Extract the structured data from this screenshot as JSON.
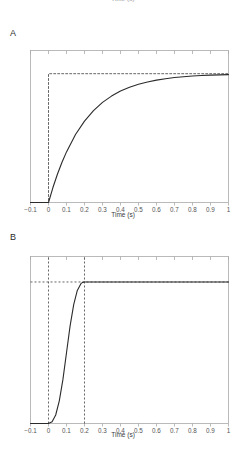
{
  "figure": {
    "clipped_top_caption": "Time (s)",
    "background_color": "#ffffff",
    "line_color": "#2b2b2b",
    "dashed_color": "#555555",
    "axis_color": "#aaaaaa",
    "tick_label_color": "#555555"
  },
  "panels": [
    {
      "letter": "A",
      "xlabel": "Time (s)",
      "tick_labels": [
        "−0.1",
        "0",
        "0.1",
        "0.2",
        "0.3",
        "0.4",
        "0.5",
        "0.6",
        "0.7",
        "0.8",
        "0.9",
        "1"
      ]
    },
    {
      "letter": "B",
      "xlabel": "Time (s)",
      "tick_labels": [
        "−0.1",
        "0",
        "0.1",
        "0.2",
        "0.3",
        "0.4",
        "0.5",
        "0.6",
        "0.7",
        "0.8",
        "0.9",
        "1"
      ]
    }
  ],
  "chart_data": [
    {
      "type": "line",
      "panel": "A",
      "title": "",
      "xlabel": "Time (s)",
      "ylabel": "",
      "xlim": [
        -0.1,
        1.0
      ],
      "ylim": [
        0.0,
        1.18
      ],
      "xticks": [
        -0.1,
        0,
        0.1,
        0.2,
        0.3,
        0.4,
        0.5,
        0.6,
        0.7,
        0.8,
        0.9,
        1.0
      ],
      "xtick_labels": [
        "−0.1",
        "0",
        "0.1",
        "0.2",
        "0.3",
        "0.4",
        "0.5",
        "0.6",
        "0.7",
        "0.8",
        "0.9",
        "1"
      ],
      "yticks": [],
      "grid": false,
      "legend": false,
      "series": [
        {
          "name": "step input",
          "style": "dashed",
          "color": "#555555",
          "x": [
            -0.1,
            0.0,
            0.0,
            1.0
          ],
          "y": [
            0.0,
            0.0,
            1.0,
            1.0
          ]
        },
        {
          "name": "first-order response",
          "style": "solid",
          "color": "#2b2b2b",
          "description": "y = 0 for t<0; y = 1 - exp(-t/0.2) for t>=0",
          "x": [
            -0.1,
            -0.05,
            0.0,
            0.025,
            0.05,
            0.075,
            0.1,
            0.15,
            0.2,
            0.25,
            0.3,
            0.35,
            0.4,
            0.45,
            0.5,
            0.55,
            0.6,
            0.65,
            0.7,
            0.75,
            0.8,
            0.85,
            0.9,
            0.95,
            1.0
          ],
          "y": [
            0.0,
            0.0,
            0.0,
            0.118,
            0.221,
            0.313,
            0.393,
            0.528,
            0.632,
            0.713,
            0.777,
            0.826,
            0.865,
            0.895,
            0.918,
            0.936,
            0.95,
            0.961,
            0.97,
            0.976,
            0.982,
            0.986,
            0.989,
            0.991,
            0.993
          ]
        }
      ]
    },
    {
      "type": "line",
      "panel": "B",
      "title": "",
      "xlabel": "Time (s)",
      "ylabel": "",
      "xlim": [
        -0.1,
        1.0
      ],
      "ylim": [
        0.0,
        1.18
      ],
      "xticks": [
        -0.1,
        0,
        0.1,
        0.2,
        0.3,
        0.4,
        0.5,
        0.6,
        0.7,
        0.8,
        0.9,
        1.0
      ],
      "xtick_labels": [
        "−0.1",
        "0",
        "0.1",
        "0.2",
        "0.3",
        "0.4",
        "0.5",
        "0.6",
        "0.7",
        "0.8",
        "0.9",
        "1"
      ],
      "yticks": [],
      "grid": false,
      "legend": false,
      "annotations": [
        {
          "name": "onset-marker",
          "type": "vline",
          "x": 0.0,
          "style": "dashed"
        },
        {
          "name": "plateau-marker",
          "type": "vline",
          "x": 0.2,
          "style": "dashed"
        },
        {
          "name": "plateau-level",
          "type": "hline",
          "y": 1.0,
          "style": "dashed"
        }
      ],
      "series": [
        {
          "name": "sigmoid response",
          "style": "solid",
          "color": "#2b2b2b",
          "description": "smooth sigmoidal rise from 0 at t=0 to plateau 1.0 at t=0.2, flat thereafter",
          "x": [
            -0.1,
            -0.05,
            0.0,
            0.02,
            0.04,
            0.06,
            0.08,
            0.1,
            0.12,
            0.14,
            0.16,
            0.18,
            0.19,
            0.2,
            0.3,
            0.4,
            0.5,
            0.6,
            0.7,
            0.8,
            0.9,
            1.0
          ],
          "y": [
            0.0,
            0.0,
            0.0,
            0.012,
            0.06,
            0.16,
            0.31,
            0.5,
            0.69,
            0.84,
            0.94,
            0.988,
            0.997,
            1.0,
            1.0,
            1.0,
            1.0,
            1.0,
            1.0,
            1.0,
            1.0,
            1.0
          ]
        }
      ]
    }
  ]
}
